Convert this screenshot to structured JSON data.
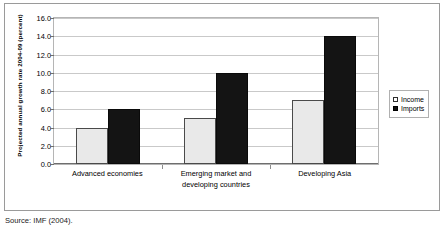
{
  "chart_data": {
    "type": "bar",
    "title": "",
    "xlabel": "",
    "ylabel": "Projected annual growth rate 2004-09 (percent)",
    "ylim": [
      0,
      16
    ],
    "ytick_step": 2,
    "ytick_labels": [
      "0.0",
      "2.0",
      "4.0",
      "6.0",
      "8.0",
      "10.0",
      "12.0",
      "14.0",
      "16.0"
    ],
    "grid": true,
    "legend_position": "right",
    "categories": [
      "Advanced economies",
      "Emerging market and developing countries",
      "Developing Asia"
    ],
    "category_lines": [
      [
        "Advanced economies"
      ],
      [
        "Emerging market and",
        "developing countries"
      ],
      [
        "Developing Asia"
      ]
    ],
    "series": [
      {
        "name": "Income",
        "values": [
          4.0,
          5.0,
          7.0
        ],
        "color": "#e9e9e9"
      },
      {
        "name": "Imports",
        "values": [
          6.0,
          10.0,
          14.0
        ],
        "color": "#141414"
      }
    ]
  },
  "legend": {
    "items": [
      {
        "label": "Income",
        "swatch": "income-swatch"
      },
      {
        "label": "Imports",
        "swatch": "imports-swatch"
      }
    ]
  },
  "caption": {
    "source": "Source: IMF (2004)."
  }
}
